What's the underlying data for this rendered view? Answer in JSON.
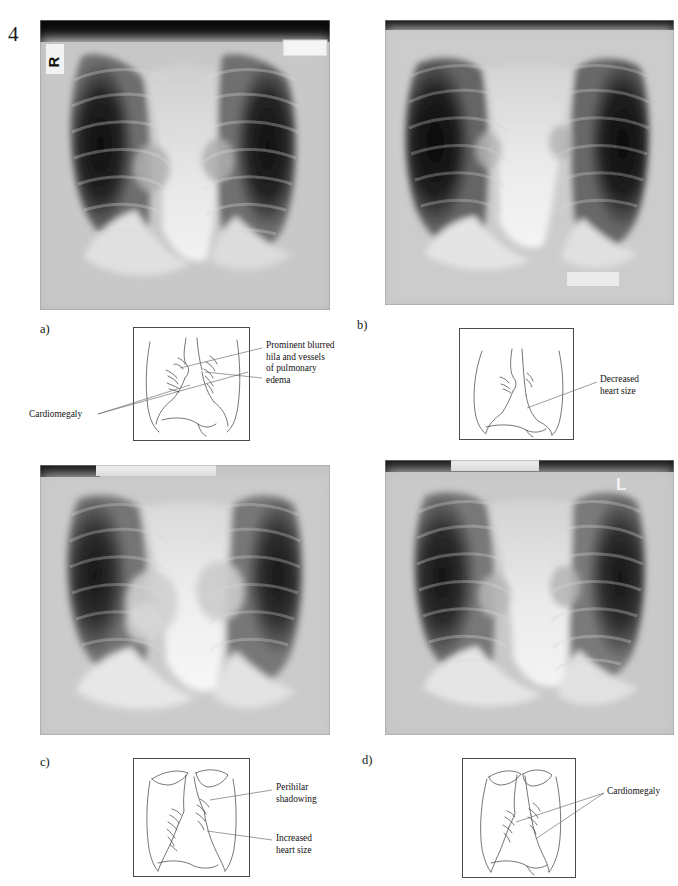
{
  "page": {
    "number": "4",
    "figure_type": "chest-radiograph-series",
    "background": "#ffffff",
    "ink": "#141414"
  },
  "panels": [
    {
      "id": "a",
      "letter": "a)",
      "radiograph": {
        "name": "chest-xray-a",
        "side_marker": "R",
        "marker_corner": "top-left",
        "has_blank_label_strip": true,
        "findings": "Enlarged cardiac silhouette with prominent blurred hila and pulmonary vessels"
      },
      "diagram": {
        "name": "line-drawing-a",
        "annotations": [
          {
            "id": "a-edema",
            "text": "Prominent blurred\nhila and vessels\nof pulmonary\nedema",
            "position": "right"
          },
          {
            "id": "a-cardiomegaly",
            "text": "Cardiomegaly",
            "position": "left"
          }
        ]
      }
    },
    {
      "id": "b",
      "letter": "b)",
      "radiograph": {
        "name": "chest-xray-b",
        "side_marker": "",
        "marker_corner": "",
        "has_blank_label_strip": false,
        "findings": "Clear lung fields with reduced cardiac silhouette after treatment"
      },
      "diagram": {
        "name": "line-drawing-b",
        "annotations": [
          {
            "id": "b-heart",
            "text": "Decreased\nheart size",
            "position": "right"
          }
        ]
      }
    },
    {
      "id": "c",
      "letter": "c)",
      "radiograph": {
        "name": "chest-xray-c",
        "side_marker": "",
        "marker_corner": "",
        "has_blank_label_strip": true,
        "findings": "Bilateral perihilar shadowing with enlarged heart"
      },
      "diagram": {
        "name": "line-drawing-c",
        "annotations": [
          {
            "id": "c-perihilar",
            "text": "Perihilar\nshadowing",
            "position": "right"
          },
          {
            "id": "c-heart",
            "text": "Increased\nheart size",
            "position": "right"
          }
        ]
      }
    },
    {
      "id": "d",
      "letter": "d)",
      "radiograph": {
        "name": "chest-xray-d",
        "side_marker": "L",
        "marker_corner": "top-right",
        "has_blank_label_strip": true,
        "findings": "Enlarged cardiac silhouette, cardiomegaly"
      },
      "diagram": {
        "name": "line-drawing-d",
        "annotations": [
          {
            "id": "d-cardiomegaly",
            "text": "Cardiomegaly",
            "position": "right"
          }
        ]
      }
    }
  ]
}
